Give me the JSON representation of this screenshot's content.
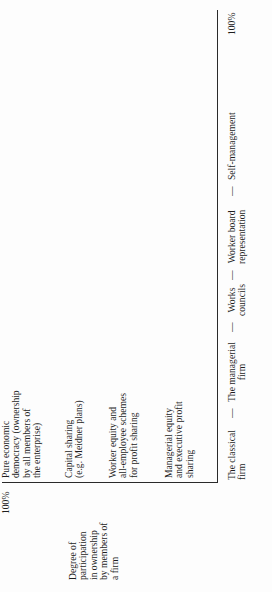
{
  "figure": {
    "orientation": "rotated 90 degrees counter-clockwise",
    "y_axis": {
      "title": "Degree of\nparticipation\nin ownership\nby members of\na firm",
      "max_label": "100%",
      "categories": [
        "Managerial equity\nand executive profit\nsharing",
        "Worker equity and\nall-employee schemes\nfor profit sharing",
        "Capital sharing\n(e.g. Meidner plans)",
        "Pure economic\ndemocracy (ownership\nby all members of\nthe enterprise)"
      ]
    },
    "x_axis": {
      "max_label": "100%",
      "separator": "—",
      "categories": [
        "The classical\nfirm",
        "The managerial\nfirm",
        "Works\ncouncils",
        "Worker board\nrepresentation",
        "Self-management"
      ]
    }
  }
}
